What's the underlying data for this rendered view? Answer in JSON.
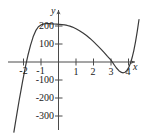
{
  "chart_data": {
    "type": "line",
    "title": "",
    "xlabel": "x",
    "ylabel": "y",
    "xlim": [
      -2.6,
      4.7
    ],
    "ylim": [
      -380,
      260
    ],
    "grid": false,
    "legend": false,
    "x_ticks": [
      -2,
      -1,
      1,
      2,
      3,
      4
    ],
    "x_tick_labels": [
      "-2",
      "-1",
      "1",
      "2",
      "3",
      "4"
    ],
    "y_ticks": [
      200,
      100,
      -100,
      -200,
      -300
    ],
    "y_tick_labels": [
      "200",
      "100",
      "-100",
      "-200",
      "-300"
    ],
    "annotations": [],
    "series": [
      {
        "name": "polynomial",
        "color": "#3a3a3a",
        "x": [
          -2.55,
          -2.45,
          -2.35,
          -2.25,
          -2.15,
          -2.05,
          -1.95,
          -1.85,
          -1.75,
          -1.6,
          -1.45,
          -1.3,
          -1.15,
          -1.0,
          -0.85,
          -0.7,
          -0.55,
          -0.4,
          -0.25,
          -0.1,
          0.05,
          0.2,
          0.35,
          0.5,
          0.65,
          0.8,
          1.0,
          1.2,
          1.4,
          1.6,
          1.8,
          2.0,
          2.2,
          2.4,
          2.6,
          2.8,
          3.0,
          3.2,
          3.3,
          3.45,
          3.6,
          3.7,
          3.8,
          3.9,
          4.0,
          4.1,
          4.2,
          4.3,
          4.4,
          4.5,
          4.6
        ],
        "y": [
          -390,
          -330,
          -272,
          -214,
          -160,
          -106,
          -56,
          -8,
          36,
          92,
          140,
          174,
          196,
          206,
          211,
          213,
          213,
          212,
          211,
          210,
          209,
          208,
          206,
          203,
          199,
          194,
          185,
          174,
          161,
          147,
          131,
          113,
          94,
          74,
          53,
          31,
          10,
          -18,
          -32,
          -48,
          -58,
          -60,
          -57,
          -48,
          -33,
          -10,
          22,
          62,
          112,
          170,
          236
        ]
      }
    ]
  },
  "axes": {
    "x_axis_label": "x",
    "y_axis_label": "y",
    "axis_color": "#4a4a4a"
  }
}
